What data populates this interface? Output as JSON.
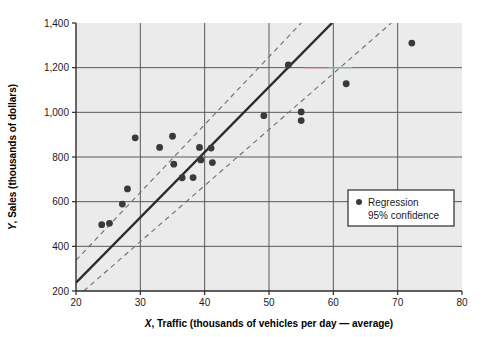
{
  "chart_data": {
    "type": "scatter",
    "title": "",
    "xlabel": "X, Traffic (thousands of vehicles per day — average)",
    "xlabel_prefix": "X",
    "xlabel_rest": ", Traffic (thousands of vehicles per day — average)",
    "ylabel": "Y, Sales (thousands of dollars)",
    "ylabel_prefix": "Y",
    "ylabel_rest": ", Sales (thousands of dollars)",
    "xlim": [
      20,
      80
    ],
    "ylim": [
      200,
      1400
    ],
    "xticks": [
      20,
      30,
      40,
      50,
      60,
      70,
      80
    ],
    "xtick_labels": [
      "20",
      "30",
      "40",
      "50",
      "60",
      "70",
      "80"
    ],
    "yticks": [
      200,
      400,
      600,
      800,
      1000,
      1200,
      1400
    ],
    "ytick_labels": [
      "200",
      "400",
      "600",
      "800",
      "1,000",
      "1,200",
      "1,400"
    ],
    "grid": true,
    "legend_position": "right-middle",
    "legend_entries": [
      {
        "marker": "dot",
        "label": "Regression"
      },
      {
        "marker": "none",
        "label": "95% confidence"
      }
    ],
    "series": [
      {
        "name": "Observations",
        "type": "scatter",
        "marker": "filled-circle",
        "color": "#3a3a3a",
        "points": [
          {
            "x": 24.0,
            "y": 497
          },
          {
            "x": 25.2,
            "y": 503
          },
          {
            "x": 27.2,
            "y": 589
          },
          {
            "x": 28.0,
            "y": 657
          },
          {
            "x": 29.2,
            "y": 886
          },
          {
            "x": 33.0,
            "y": 843
          },
          {
            "x": 35.0,
            "y": 893
          },
          {
            "x": 35.2,
            "y": 768
          },
          {
            "x": 36.5,
            "y": 707
          },
          {
            "x": 38.2,
            "y": 708
          },
          {
            "x": 39.2,
            "y": 843
          },
          {
            "x": 39.4,
            "y": 787
          },
          {
            "x": 41.0,
            "y": 840
          },
          {
            "x": 41.2,
            "y": 775
          },
          {
            "x": 49.2,
            "y": 985
          },
          {
            "x": 53.0,
            "y": 1212
          },
          {
            "x": 55.0,
            "y": 1002
          },
          {
            "x": 55.0,
            "y": 963
          },
          {
            "x": 62.0,
            "y": 1128
          },
          {
            "x": 72.2,
            "y": 1310
          }
        ]
      },
      {
        "name": "Regression",
        "type": "line",
        "style": "solid",
        "color": "#2b2b2b",
        "endpoints": [
          {
            "x": 20.0,
            "y": 237
          },
          {
            "x": 59.8,
            "y": 1400
          }
        ]
      },
      {
        "name": "95% confidence upper",
        "type": "line",
        "style": "dashed",
        "color": "#6e6e6e",
        "endpoints": [
          {
            "x": 20.0,
            "y": 338
          },
          {
            "x": 55.0,
            "y": 1400
          }
        ]
      },
      {
        "name": "95% confidence lower",
        "type": "line",
        "style": "dashed",
        "color": "#6e6e6e",
        "endpoints": [
          {
            "x": 21.2,
            "y": 200
          },
          {
            "x": 69.0,
            "y": 1400
          }
        ]
      }
    ],
    "annotations": [
      {
        "name": "gridline-artifact",
        "description": "faint red and green segment overlapping the 1,200 gridline",
        "x_start": 55.5,
        "x_end": 63.0,
        "y": 1200,
        "colors": [
          "#e8607a",
          "#7fbfa8"
        ]
      }
    ],
    "colors": {
      "plot_background": "#ebebeb",
      "grid": "#5a5a5a",
      "axis": "#2b2b2b",
      "marker": "#3a3a3a",
      "regression_line": "#2b2b2b",
      "confidence_line": "#6e6e6e",
      "page_background": "#ffffff",
      "legend_background": "#ffffff",
      "legend_border": "#2b2b2b"
    }
  }
}
